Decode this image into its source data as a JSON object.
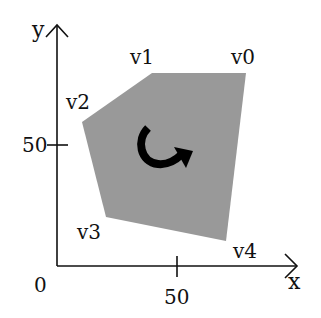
{
  "diagram": {
    "axes": {
      "x_label": "x",
      "y_label": "y",
      "origin_label": "0",
      "x_tick_label": "50",
      "y_tick_label": "50"
    },
    "polygon": {
      "fill_color": "#999999",
      "vertices": [
        {
          "label": "v0",
          "x": 246,
          "y": 73
        },
        {
          "label": "v1",
          "x": 152,
          "y": 73
        },
        {
          "label": "v2",
          "x": 82,
          "y": 122
        },
        {
          "label": "v3",
          "x": 106,
          "y": 217
        },
        {
          "label": "v4",
          "x": 226,
          "y": 241
        }
      ]
    },
    "rotation_arrow": {
      "icon": "clockwise-curved-arrow-icon",
      "color": "#000000"
    },
    "axis_color": "#111111"
  }
}
